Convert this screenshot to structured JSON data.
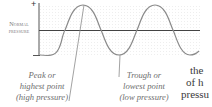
{
  "figure": {
    "axis": {
      "top_sign": "+",
      "bottom_sign": "−",
      "baseline_label_line1": "Normal",
      "baseline_label_line2": "pressure"
    },
    "callouts": {
      "peak": {
        "line1": "Peak or",
        "line2": "highest point",
        "line3": "(high pressure)"
      },
      "trough": {
        "line1": "Trough or",
        "line2": "lowest point",
        "line3": "(low pressure)"
      }
    },
    "colors": {
      "wave": "#8a8a8a",
      "axis": "#555555",
      "baseline": "#444444",
      "pointer": "#8a8a8a",
      "label": "#7a7a7a"
    }
  },
  "body_text": {
    "line1": "the",
    "line2": "of h",
    "line3": "pressu"
  }
}
